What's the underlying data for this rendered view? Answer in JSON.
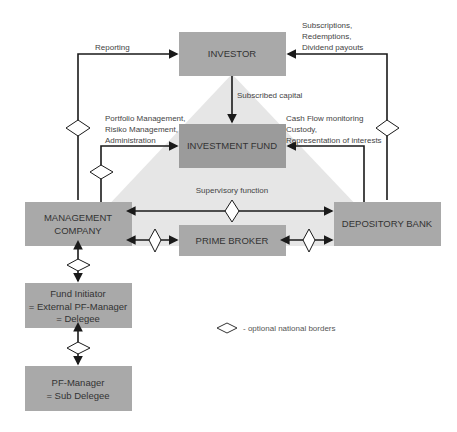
{
  "colors": {
    "box_fill": "#a9a9a9",
    "fund_fill": "#9b9b9b",
    "triangle_fill": "#e6e6e6",
    "line": "#1a1a1a",
    "diamond_fill": "#ffffff"
  },
  "nodes": {
    "investor": {
      "lines": [
        "INVESTOR"
      ]
    },
    "investment_fund": {
      "lines": [
        "INVESTMENT FUND"
      ]
    },
    "management_company": {
      "lines": [
        "MANAGEMENT",
        "COMPANY"
      ]
    },
    "prime_broker": {
      "lines": [
        "PRIME BROKER"
      ]
    },
    "depository_bank": {
      "lines": [
        "DEPOSITORY BANK"
      ]
    },
    "fund_initiator": {
      "lines": [
        "Fund Initiator",
        "= External PF-Manager",
        "= Delegee"
      ]
    },
    "pf_manager": {
      "lines": [
        "PF-Manager",
        "= Sub Delegee"
      ]
    }
  },
  "edges": {
    "reporting": {
      "lines": [
        "Reporting"
      ]
    },
    "subscriptions": {
      "lines": [
        "Subscriptions,",
        "Redemptions,",
        "Dividend payouts"
      ]
    },
    "subscribed_capital": {
      "lines": [
        "Subscribed capital"
      ]
    },
    "portfolio_mgmt": {
      "lines": [
        "Portfolio Management,",
        "Risiko Management,",
        "Administration"
      ]
    },
    "cash_flow": {
      "lines": [
        "Cash Flow monitoring",
        "Custody,",
        "Representation of interests"
      ]
    },
    "supervisory": {
      "lines": [
        "Supervisory function"
      ]
    }
  },
  "legend": {
    "symbol": "diamond-icon",
    "label": "-  optional national borders"
  }
}
